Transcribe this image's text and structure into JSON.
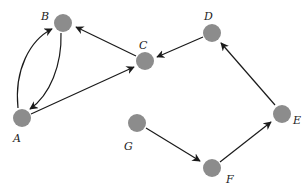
{
  "diagram": {
    "type": "directed-graph",
    "nodes": [
      {
        "id": "A",
        "label": "A",
        "x": 22,
        "y": 118
      },
      {
        "id": "B",
        "label": "B",
        "x": 63,
        "y": 23
      },
      {
        "id": "C",
        "label": "C",
        "x": 145,
        "y": 61
      },
      {
        "id": "D",
        "label": "D",
        "x": 212,
        "y": 33
      },
      {
        "id": "E",
        "label": "E",
        "x": 282,
        "y": 114
      },
      {
        "id": "F",
        "label": "F",
        "x": 212,
        "y": 168
      },
      {
        "id": "G",
        "label": "G",
        "x": 137,
        "y": 123
      }
    ],
    "edges": [
      {
        "from": "A",
        "to": "B",
        "style": "curved"
      },
      {
        "from": "B",
        "to": "A",
        "style": "curved"
      },
      {
        "from": "A",
        "to": "C",
        "style": "straight"
      },
      {
        "from": "C",
        "to": "B",
        "style": "straight"
      },
      {
        "from": "D",
        "to": "C",
        "style": "straight"
      },
      {
        "from": "E",
        "to": "D",
        "style": "straight"
      },
      {
        "from": "F",
        "to": "E",
        "style": "straight"
      },
      {
        "from": "G",
        "to": "F",
        "style": "straight"
      }
    ],
    "node_color": "#8c8c8c",
    "edge_color": "#1a1a1a"
  }
}
